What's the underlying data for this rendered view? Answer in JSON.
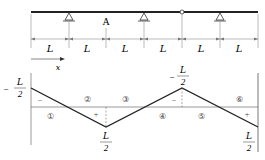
{
  "beam": {
    "support_label": "A",
    "span_labels": [
      "L",
      "L",
      "L",
      "L",
      "L",
      "L"
    ],
    "axis_label": "x",
    "hinge": "internal-hinge"
  },
  "influence_line": {
    "values": [
      {
        "text_sign": "−",
        "num": "L",
        "den": "2"
      },
      {
        "text_sign": "",
        "num": "L",
        "den": "2"
      },
      {
        "text_sign": "−",
        "num": "L",
        "den": "2"
      },
      {
        "text_sign": "",
        "num": "L",
        "den": "2"
      }
    ],
    "region_labels": [
      "①",
      "②",
      "③",
      "④",
      "⑤",
      "⑥"
    ],
    "signs": [
      "−",
      "+",
      "−",
      "+"
    ],
    "colors": {
      "line": "#222222",
      "thin": "#555555"
    }
  }
}
